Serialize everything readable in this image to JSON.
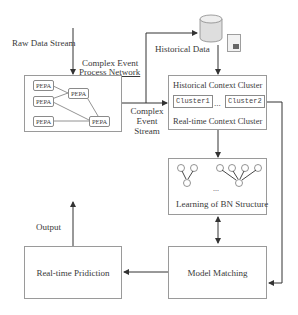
{
  "diagram": {
    "raw_data_stream": "Raw Data Stream",
    "cepn_title_line1": "Complex Event",
    "cepn_title_line2": "Process Network",
    "pepa_nodes": [
      "PEPA",
      "PEPA",
      "PEPA",
      "PEPA",
      "PEPA"
    ],
    "complex_event_stream_line1": "Complex",
    "complex_event_stream_line2": "Event",
    "complex_event_stream_line3": "Stream",
    "historical_data": "Historical Data",
    "historical_context_cluster": "Historical Context Cluster",
    "cluster1": "Cluster1",
    "cluster_ellipsis": "...",
    "cluster2": "Cluster2",
    "realtime_context_cluster": "Real-time Context Cluster",
    "bn_ellipsis": "...",
    "learning_bn_structure": "Learning of BN Structure",
    "model_matching": "Model Matching",
    "realtime_prediction": "Real-time Pridiction",
    "output": "Output"
  },
  "colors": {
    "line": "#3a3a3a",
    "box_border": "#9a9a9a",
    "database": "#d9d9d9"
  }
}
